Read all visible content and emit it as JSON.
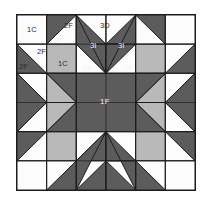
{
  "figure": {
    "kind": "quilt-block-diagram",
    "name": "Feathered star quilt block",
    "grid": {
      "columns": 6,
      "rows": 6,
      "cell_px": 29.5
    },
    "frame": {
      "x": 16,
      "y": 14,
      "width": 180,
      "height": 177,
      "border_color": "#1c1c1c"
    }
  },
  "colors": {
    "background": "#ffffff",
    "white_patch": "#fdfdfd",
    "light_gray_patch": "#b9b9b9",
    "dark_gray_patch": "#5c5c5c",
    "outline": "#1c1c1c",
    "label_dark": "#2b2b2b",
    "label_light": "#f2f2f2"
  },
  "labels": [
    {
      "id": "l1",
      "text": "1C",
      "x": 27,
      "y": 26,
      "tone": "dark"
    },
    {
      "id": "l2",
      "text": "2F",
      "x": 64,
      "y": 22,
      "tone": "dark"
    },
    {
      "id": "l3",
      "text": "2F",
      "x": 54,
      "y": 36,
      "tone": "light"
    },
    {
      "id": "l4",
      "text": "3D",
      "x": 100,
      "y": 22,
      "tone": "dark"
    },
    {
      "id": "l5",
      "text": "3I",
      "x": 90,
      "y": 42,
      "tone": "light"
    },
    {
      "id": "l6",
      "text": "3I",
      "x": 118,
      "y": 42,
      "tone": "light"
    },
    {
      "id": "l7",
      "text": "2F",
      "x": 37,
      "y": 48,
      "tone": "dark"
    },
    {
      "id": "l8",
      "text": "2F",
      "x": 19,
      "y": 63,
      "tone": "dark"
    },
    {
      "id": "l9",
      "text": "1C",
      "x": 58,
      "y": 60,
      "tone": "dark"
    },
    {
      "id": "l10",
      "text": "2F",
      "x": 83,
      "y": 64,
      "tone": "light"
    },
    {
      "id": "l11",
      "text": "2F",
      "x": 124,
      "y": 64,
      "tone": "light"
    },
    {
      "id": "l12",
      "text": "1F",
      "x": 100,
      "y": 98,
      "tone": "light"
    }
  ],
  "legend_keys": [
    {
      "code": "1C",
      "meaning": "1C"
    },
    {
      "code": "2F",
      "meaning": "2F"
    },
    {
      "code": "3D",
      "meaning": "3D"
    },
    {
      "code": "3I",
      "meaning": "3I"
    },
    {
      "code": "1F",
      "meaning": "1F"
    }
  ],
  "chart_data": {
    "type": "diagram",
    "patch_codes": [
      "1C",
      "2F",
      "3D",
      "3I",
      "1F"
    ],
    "patch_counts": {
      "1C": 2,
      "2F": 6,
      "3D": 1,
      "3I": 2,
      "1F": 1
    }
  }
}
